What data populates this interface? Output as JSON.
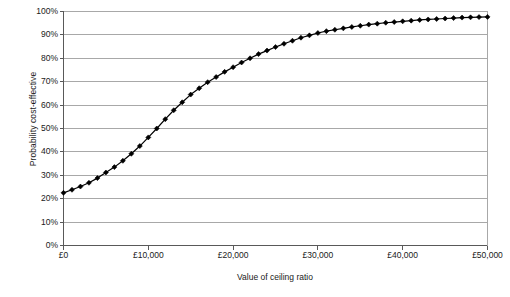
{
  "figure": {
    "background_color": "#ffffff",
    "plot_border_color": "#808080",
    "gridline_color": "#a8a8a8",
    "series_color": "#000000"
  },
  "axes": {
    "y_title": "Probability cost-effective",
    "x_title": "Value of ceiling ratio",
    "y_tick_labels": [
      "100%",
      "90%",
      "80%",
      "70%",
      "60%",
      "50%",
      "40%",
      "30%",
      "20%",
      "10%",
      "0%"
    ],
    "x_tick_labels": [
      "£0",
      "£10,000",
      "£20,000",
      "£30,000",
      "£40,000",
      "£50,000"
    ]
  },
  "caption": {
    "cropped_text": ""
  },
  "chart_data": {
    "type": "line",
    "title": "",
    "subtitle": "",
    "xlabel": "Value of ceiling ratio",
    "ylabel": "Probability cost-effective",
    "xlim": [
      0,
      50000
    ],
    "ylim": [
      0,
      1.0
    ],
    "x_ticks": [
      0,
      10000,
      20000,
      30000,
      40000,
      50000
    ],
    "y_ticks": [
      0,
      0.1,
      0.2,
      0.3,
      0.4,
      0.5,
      0.6,
      0.7,
      0.8,
      0.9,
      1.0
    ],
    "y_tick_format": "percent",
    "x_tick_format": "currency_gbp",
    "grid": "horizontal",
    "legend": "none",
    "marker": "diamond",
    "series": [
      {
        "name": "Probability cost-effective",
        "x": [
          0,
          1000,
          2000,
          3000,
          4000,
          5000,
          6000,
          7000,
          8000,
          9000,
          10000,
          11000,
          12000,
          13000,
          14000,
          15000,
          16000,
          17000,
          18000,
          19000,
          20000,
          21000,
          22000,
          23000,
          24000,
          25000,
          26000,
          27000,
          28000,
          29000,
          30000,
          31000,
          32000,
          33000,
          34000,
          35000,
          36000,
          37000,
          38000,
          39000,
          40000,
          41000,
          42000,
          43000,
          44000,
          45000,
          46000,
          47000,
          48000,
          49000,
          50000
        ],
        "values": [
          0.225,
          0.238,
          0.252,
          0.268,
          0.288,
          0.312,
          0.335,
          0.362,
          0.392,
          0.425,
          0.462,
          0.5,
          0.54,
          0.578,
          0.612,
          0.645,
          0.672,
          0.698,
          0.72,
          0.742,
          0.762,
          0.782,
          0.8,
          0.818,
          0.833,
          0.848,
          0.862,
          0.875,
          0.888,
          0.898,
          0.908,
          0.916,
          0.922,
          0.928,
          0.934,
          0.939,
          0.944,
          0.948,
          0.952,
          0.955,
          0.958,
          0.961,
          0.964,
          0.966,
          0.968,
          0.97,
          0.972,
          0.974,
          0.975,
          0.976,
          0.977
        ]
      }
    ]
  }
}
